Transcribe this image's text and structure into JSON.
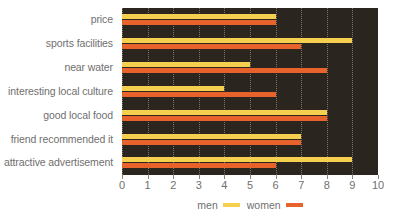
{
  "chart_data": {
    "type": "bar",
    "orientation": "horizontal",
    "title": "",
    "xlabel": "",
    "ylabel": "",
    "xlim": [
      0,
      10
    ],
    "grid": true,
    "legend_position": "bottom",
    "categories": [
      "price",
      "sports facilities",
      "near water",
      "interesting local culture",
      "good local food",
      "friend recommended it",
      "attractive advertisement"
    ],
    "series": [
      {
        "name": "men",
        "color": "#f5d04e",
        "values": [
          6,
          9,
          5,
          4,
          8,
          7,
          9
        ]
      },
      {
        "name": "women",
        "color": "#e8622c",
        "values": [
          6,
          7,
          8,
          6,
          8,
          7,
          6
        ]
      }
    ],
    "tick_labels": [
      "0",
      "1",
      "2",
      "3",
      "4",
      "5",
      "6",
      "7",
      "8",
      "9",
      "10"
    ],
    "plot_background": "#2a251f",
    "gridline_color": "#8d8373",
    "text_color": "#6f6f6f"
  },
  "legend": {
    "entries": [
      {
        "label": "men",
        "color": "#f5d04e"
      },
      {
        "label": "women",
        "color": "#e8622c"
      }
    ]
  }
}
